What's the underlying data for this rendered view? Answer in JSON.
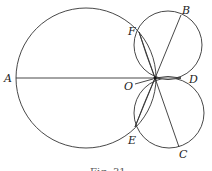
{
  "figure": {
    "caption": "Fig. 31",
    "points": {
      "A": {
        "label": "A",
        "x": 16,
        "y": 78
      },
      "O": {
        "label": "O",
        "x": 155,
        "y": 78
      },
      "B": {
        "label": "B",
        "x": 181,
        "y": 14
      },
      "C": {
        "label": "C",
        "x": 179,
        "y": 148
      },
      "D": {
        "label": "D",
        "x": 182,
        "y": 79
      },
      "E": {
        "label": "E",
        "x": 135,
        "y": 128
      },
      "F": {
        "label": "F",
        "x": 139,
        "y": 32
      }
    },
    "circles": [
      {
        "name": "large-circle",
        "cx": 86,
        "cy": 78,
        "r": 70
      },
      {
        "name": "upper-small-circle",
        "cx": 168,
        "cy": 45,
        "r": 34
      },
      {
        "name": "lower-small-circle",
        "cx": 169,
        "cy": 113,
        "r": 35
      }
    ],
    "stroke_color": "#333333"
  }
}
